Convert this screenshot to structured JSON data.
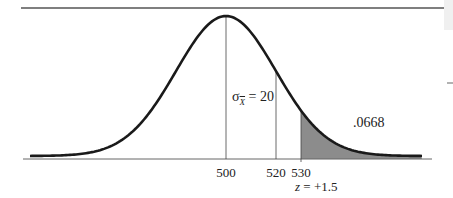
{
  "chart_data": {
    "type": "area",
    "title": "",
    "mean": 500,
    "standard_error": 20,
    "standard_error_label": "σX̄ = 20",
    "sigma_symbol": "σ",
    "sigma_subscript": "X",
    "sigma_value": "= 20",
    "x_ticks": [
      {
        "value": 500,
        "label": "500"
      },
      {
        "value": 520,
        "label": "520"
      },
      {
        "value": 530,
        "label": "530"
      }
    ],
    "vertical_lines_at": [
      500,
      520,
      530
    ],
    "shaded_region": {
      "from": 530,
      "to": "right tail",
      "area": 0.0668,
      "label": ".0668",
      "color": "#8c8c8c"
    },
    "z_annotation": {
      "z_prefix": "z",
      "z_rest": " = +1.5",
      "z": 1.5
    },
    "xlabel": "",
    "ylabel": "",
    "grid": false,
    "legend": "none",
    "colors": {
      "curve": "#1a1a1a",
      "shade": "#8c8c8c",
      "lines": "#444444"
    }
  }
}
